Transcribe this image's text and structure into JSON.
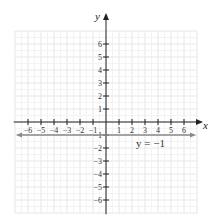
{
  "chart_data": {
    "type": "line",
    "title": "",
    "xlabel": "x",
    "ylabel": "y",
    "xlim": [
      -7,
      7
    ],
    "ylim": [
      -7,
      7
    ],
    "grid": true,
    "x_ticks": [
      -6,
      -5,
      -4,
      -3,
      -2,
      -1,
      1,
      2,
      3,
      4,
      5,
      6
    ],
    "y_ticks": [
      -6,
      -5,
      -4,
      -3,
      -2,
      -1,
      1,
      2,
      3,
      4,
      5,
      6
    ],
    "x_tick_labels": [
      "−6",
      "−5",
      "−4",
      "−3",
      "−2",
      "−1",
      "1",
      "2",
      "3",
      "4",
      "5",
      "6"
    ],
    "y_tick_labels": [
      "−6",
      "−5",
      "−4",
      "−3",
      "−2",
      "−1",
      "1",
      "2",
      "3",
      "4",
      "5",
      "6"
    ],
    "series": [
      {
        "name": "y = −1",
        "equation": "y = -1",
        "x": [
          -7,
          7
        ],
        "y": [
          -1,
          -1
        ],
        "color": "#8a8a8a",
        "arrows": "both"
      }
    ],
    "annotations": [
      {
        "text": "y = −1",
        "x": 3.3,
        "y": -1.6
      }
    ]
  },
  "labels": {
    "x_axis": "x",
    "y_axis": "y",
    "line_label": "y = −1"
  },
  "colors": {
    "grid": "#e6e6e6",
    "axis": "#222222",
    "line": "#8a8a8a"
  }
}
